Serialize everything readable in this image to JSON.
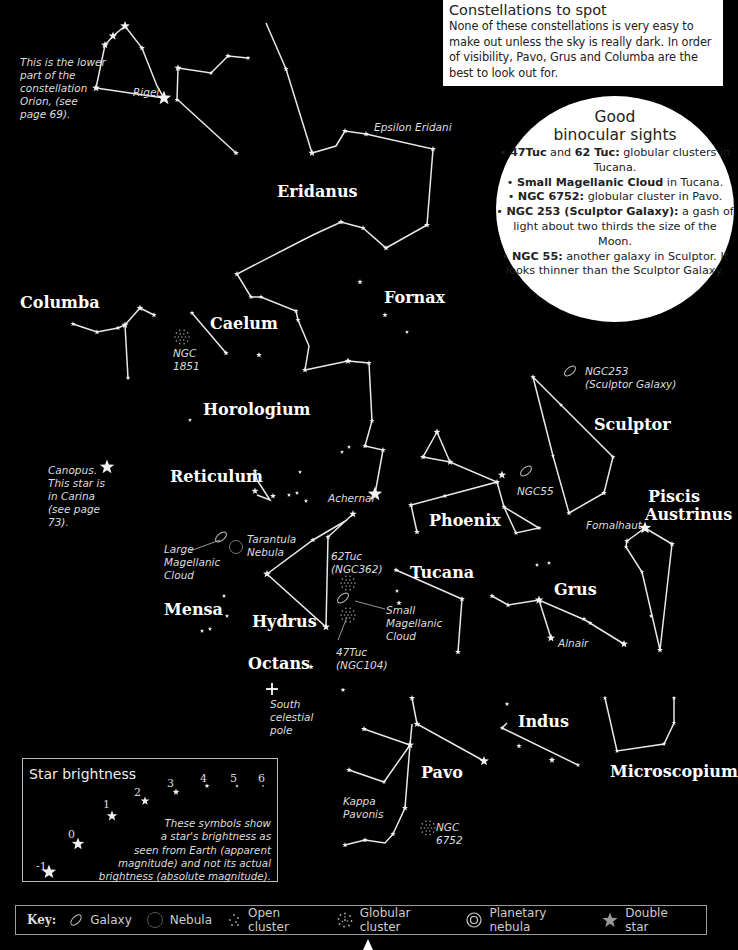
{
  "info_box": {
    "title": "Constellations to spot",
    "body": "None of these constellations is very easy to make out unless the sky is really dark. In order of visibility, Pavo, Grus and Columba are the best to look out for."
  },
  "binocular": {
    "title_line1": "Good",
    "title_line2": "binocular sights",
    "items": [
      {
        "bold": "47Tuc",
        "mid": " and ",
        "bold2": "62 Tuc:",
        "text": " globular clusters in Tucana."
      },
      {
        "bold": "Small Magellanic Cloud",
        "mid": "",
        "bold2": "",
        "text": " in Tucana."
      },
      {
        "bold": "NGC 6752:",
        "mid": "",
        "bold2": "",
        "text": " globular cluster in Pavo."
      },
      {
        "bold": "NGC 253 (Sculptor Galaxy):",
        "mid": "",
        "bold2": "",
        "text": " a gash of light about two thirds the size of the Moon."
      },
      {
        "bold": "NGC 55:",
        "mid": "",
        "bold2": "",
        "text": " another galaxy in Sculptor. It looks thinner than the Sculptor Galaxy."
      }
    ]
  },
  "constellations": [
    {
      "name": "Eridanus",
      "x": 277,
      "y": 182
    },
    {
      "name": "Fornax",
      "x": 384,
      "y": 288
    },
    {
      "name": "Columba",
      "x": 20,
      "y": 293
    },
    {
      "name": "Caelum",
      "x": 210,
      "y": 314
    },
    {
      "name": "Horologium",
      "x": 203,
      "y": 400
    },
    {
      "name": "Sculptor",
      "x": 594,
      "y": 415
    },
    {
      "name": "Reticulum",
      "x": 170,
      "y": 467
    },
    {
      "name": "Piscis",
      "x": 648,
      "y": 487
    },
    {
      "name": "Austrinus",
      "x": 645,
      "y": 505
    },
    {
      "name": "Phoenix",
      "x": 429,
      "y": 511
    },
    {
      "name": "Tucana",
      "x": 410,
      "y": 563
    },
    {
      "name": "Grus",
      "x": 554,
      "y": 580
    },
    {
      "name": "Mensa",
      "x": 164,
      "y": 600
    },
    {
      "name": "Hydrus",
      "x": 252,
      "y": 612
    },
    {
      "name": "Octans",
      "x": 248,
      "y": 654
    },
    {
      "name": "Indus",
      "x": 518,
      "y": 712
    },
    {
      "name": "Pavo",
      "x": 421,
      "y": 763
    },
    {
      "name": "Microscopium",
      "x": 610,
      "y": 762
    }
  ],
  "notes": [
    {
      "text": "This is the lower\npart of the\nconstellation\nOrion, (see\npage 69).",
      "x": 20,
      "y": 56
    },
    {
      "text": "Rigel",
      "x": 133,
      "y": 86
    },
    {
      "text": "Epsilon Eridani",
      "x": 374,
      "y": 121
    },
    {
      "text": "NGC\n1851",
      "x": 173,
      "y": 347
    },
    {
      "text": "NGC253\n(Sculptor Galaxy)",
      "x": 585,
      "y": 365
    },
    {
      "text": "Canopus.\nThis star is\nin Carina\n(see page\n73).",
      "x": 48,
      "y": 464
    },
    {
      "text": "Achernar",
      "x": 328,
      "y": 492
    },
    {
      "text": "NGC55",
      "x": 517,
      "y": 485
    },
    {
      "text": "Fomalhaut",
      "x": 586,
      "y": 519
    },
    {
      "text": "Tarantula\nNebula",
      "x": 247,
      "y": 533
    },
    {
      "text": "Large\nMagellanic\nCloud",
      "x": 164,
      "y": 543
    },
    {
      "text": "62Tuc\n(NGC362)",
      "x": 331,
      "y": 550
    },
    {
      "text": "Small\nMagellanic\nCloud",
      "x": 386,
      "y": 604
    },
    {
      "text": "Alnair",
      "x": 558,
      "y": 637
    },
    {
      "text": "47Tuc\n(NGC104)",
      "x": 336,
      "y": 646
    },
    {
      "text": "South\ncelestial\npole",
      "x": 270,
      "y": 698
    },
    {
      "text": "Kappa\nPavonis",
      "x": 343,
      "y": 795
    },
    {
      "text": "NGC\n6752",
      "x": 436,
      "y": 821
    }
  ],
  "star_brightness": {
    "title": "Star brightness",
    "description": "These symbols show\na star's brightness as\nseen from Earth (apparent\nmagnitude) and not its actual\nbrightness (absolute magnitude).",
    "magnitudes": [
      {
        "label": "-1",
        "x": 13,
        "y": 101,
        "sx": 26,
        "sy": 113,
        "r": 7.5
      },
      {
        "label": "0",
        "x": 45,
        "y": 69,
        "sx": 55,
        "sy": 85,
        "r": 6.5
      },
      {
        "label": "1",
        "x": 80,
        "y": 39,
        "sx": 89,
        "sy": 57,
        "r": 5.5
      },
      {
        "label": "2",
        "x": 111,
        "y": 27,
        "sx": 122,
        "sy": 42,
        "r": 4.5
      },
      {
        "label": "3",
        "x": 144,
        "y": 18,
        "sx": 153,
        "sy": 33,
        "r": 3.5
      },
      {
        "label": "4",
        "x": 177,
        "y": 13,
        "sx": 184,
        "sy": 27,
        "r": 2.6
      },
      {
        "label": "5",
        "x": 207,
        "y": 13,
        "sx": 214,
        "sy": 27,
        "r": 1.8
      },
      {
        "label": "6",
        "x": 235,
        "y": 13,
        "sx": 240,
        "sy": 27,
        "r": 1.2
      }
    ]
  },
  "key": {
    "label": "Key:",
    "items": [
      {
        "icon": "galaxy-icon",
        "label": "Galaxy"
      },
      {
        "icon": "nebula-icon",
        "label": "Nebula"
      },
      {
        "icon": "open-cluster-icon",
        "label": "Open cluster"
      },
      {
        "icon": "globular-cluster-icon",
        "label": "Globular cluster"
      },
      {
        "icon": "planetary-nebula-icon",
        "label": "Planetary nebula"
      },
      {
        "icon": "double-star-icon",
        "label": "Double star"
      }
    ]
  },
  "chart_lines": [
    [
      [
        96,
        88
      ],
      [
        105,
        45
      ],
      [
        113,
        36
      ],
      [
        125,
        26
      ],
      [
        142,
        48
      ],
      [
        157,
        86
      ],
      [
        164,
        98
      ]
    ],
    [
      [
        96,
        88
      ],
      [
        164,
        98
      ]
    ],
    [
      [
        178,
        68
      ],
      [
        177,
        100
      ]
    ],
    [
      [
        178,
        68
      ],
      [
        211,
        73
      ],
      [
        228,
        56
      ],
      [
        248,
        58
      ]
    ],
    [
      [
        178,
        100
      ],
      [
        236,
        153
      ]
    ],
    [
      [
        266,
        23
      ],
      [
        286,
        69
      ],
      [
        312,
        153
      ],
      [
        336,
        146
      ],
      [
        345,
        131
      ],
      [
        366,
        134
      ],
      [
        433,
        149
      ],
      [
        427,
        225
      ],
      [
        386,
        248
      ],
      [
        363,
        228
      ],
      [
        341,
        222
      ],
      [
        315,
        234
      ],
      [
        303,
        240
      ],
      [
        237,
        274
      ],
      [
        251,
        297
      ],
      [
        261,
        297
      ],
      [
        296,
        311
      ],
      [
        298,
        320
      ],
      [
        309,
        346
      ],
      [
        305,
        370
      ],
      [
        348,
        361
      ],
      [
        369,
        363
      ],
      [
        372,
        421
      ],
      [
        365,
        446
      ],
      [
        383,
        450
      ],
      [
        375,
        494
      ]
    ],
    [
      [
        73,
        324
      ],
      [
        97,
        332
      ],
      [
        118,
        328
      ],
      [
        125,
        325
      ],
      [
        140,
        308
      ],
      [
        154,
        315
      ]
    ],
    [
      [
        125,
        325
      ],
      [
        128,
        378
      ]
    ],
    [
      [
        192,
        313
      ],
      [
        226,
        353
      ]
    ],
    [
      [
        255,
        471
      ],
      [
        257,
        480
      ],
      [
        270,
        500
      ],
      [
        257,
        495
      ]
    ],
    [
      [
        353,
        514
      ],
      [
        328,
        537
      ],
      [
        326,
        627
      ],
      [
        267,
        574
      ],
      [
        313,
        540
      ],
      [
        347,
        520
      ]
    ],
    [
      [
        437,
        432
      ],
      [
        423,
        457
      ],
      [
        450,
        462
      ],
      [
        497,
        482
      ],
      [
        411,
        505
      ],
      [
        417,
        532
      ]
    ],
    [
      [
        437,
        432
      ],
      [
        450,
        462
      ]
    ],
    [
      [
        497,
        482
      ],
      [
        504,
        507
      ],
      [
        539,
        528
      ],
      [
        516,
        533
      ],
      [
        504,
        507
      ]
    ],
    [
      [
        533,
        377
      ],
      [
        561,
        405
      ],
      [
        613,
        457
      ],
      [
        604,
        493
      ],
      [
        569,
        513
      ],
      [
        553,
        456
      ],
      [
        533,
        377
      ]
    ],
    [
      [
        627,
        541
      ],
      [
        645,
        528
      ],
      [
        672,
        544
      ],
      [
        660,
        650
      ],
      [
        642,
        572
      ],
      [
        626,
        547
      ],
      [
        627,
        541
      ]
    ],
    [
      [
        492,
        596
      ],
      [
        508,
        605
      ],
      [
        539,
        600
      ],
      [
        585,
        620
      ],
      [
        624,
        644
      ]
    ],
    [
      [
        539,
        600
      ],
      [
        551,
        638
      ]
    ],
    [
      [
        396,
        570
      ],
      [
        462,
        599
      ],
      [
        458,
        652
      ]
    ],
    [
      [
        412,
        698
      ],
      [
        417,
        724
      ],
      [
        484,
        761
      ]
    ],
    [
      [
        412,
        724
      ],
      [
        410,
        745
      ],
      [
        405,
        808
      ],
      [
        393,
        834
      ]
    ],
    [
      [
        410,
        745
      ],
      [
        384,
        782
      ],
      [
        349,
        770
      ]
    ],
    [
      [
        410,
        745
      ],
      [
        364,
        729
      ]
    ],
    [
      [
        507,
        723
      ],
      [
        502,
        728
      ],
      [
        578,
        765
      ]
    ],
    [
      [
        605,
        698
      ],
      [
        617,
        751
      ],
      [
        664,
        744
      ],
      [
        674,
        723
      ],
      [
        674,
        698
      ]
    ],
    [
      [
        345,
        845
      ],
      [
        365,
        840
      ],
      [
        385,
        843
      ],
      [
        393,
        834
      ]
    ]
  ],
  "chart_stars": [
    {
      "x": 96,
      "y": 88,
      "r": 3.5
    },
    {
      "x": 105,
      "y": 45,
      "r": 3.5
    },
    {
      "x": 113,
      "y": 36,
      "r": 4
    },
    {
      "x": 125,
      "y": 26,
      "r": 4.5
    },
    {
      "x": 142,
      "y": 48,
      "r": 2.5
    },
    {
      "x": 164,
      "y": 98,
      "r": 7
    },
    {
      "x": 178,
      "y": 68,
      "r": 3.2
    },
    {
      "x": 177,
      "y": 100,
      "r": 2
    },
    {
      "x": 211,
      "y": 73,
      "r": 1.8
    },
    {
      "x": 228,
      "y": 56,
      "r": 2.3
    },
    {
      "x": 248,
      "y": 58,
      "r": 2
    },
    {
      "x": 236,
      "y": 153,
      "r": 2.3
    },
    {
      "x": 286,
      "y": 69,
      "r": 2.2
    },
    {
      "x": 312,
      "y": 153,
      "r": 3.2
    },
    {
      "x": 345,
      "y": 131,
      "r": 2.5
    },
    {
      "x": 366,
      "y": 134,
      "r": 2.5
    },
    {
      "x": 433,
      "y": 149,
      "r": 2.5
    },
    {
      "x": 427,
      "y": 225,
      "r": 2.5
    },
    {
      "x": 386,
      "y": 248,
      "r": 2.5
    },
    {
      "x": 363,
      "y": 228,
      "r": 2.2
    },
    {
      "x": 341,
      "y": 222,
      "r": 2.5
    },
    {
      "x": 237,
      "y": 274,
      "r": 2.5
    },
    {
      "x": 251,
      "y": 297,
      "r": 2
    },
    {
      "x": 261,
      "y": 297,
      "r": 2
    },
    {
      "x": 296,
      "y": 311,
      "r": 2
    },
    {
      "x": 298,
      "y": 320,
      "r": 2
    },
    {
      "x": 348,
      "y": 361,
      "r": 3
    },
    {
      "x": 369,
      "y": 363,
      "r": 2.2
    },
    {
      "x": 305,
      "y": 370,
      "r": 2.5
    },
    {
      "x": 372,
      "y": 421,
      "r": 2
    },
    {
      "x": 365,
      "y": 446,
      "r": 2.2
    },
    {
      "x": 383,
      "y": 450,
      "r": 2.3
    },
    {
      "x": 375,
      "y": 494,
      "r": 7
    },
    {
      "x": 360,
      "y": 282,
      "r": 2.2
    },
    {
      "x": 385,
      "y": 315,
      "r": 2.2
    },
    {
      "x": 407,
      "y": 332,
      "r": 1.5
    },
    {
      "x": 259,
      "y": 355,
      "r": 2.3
    },
    {
      "x": 349,
      "y": 447,
      "r": 1.5
    },
    {
      "x": 342,
      "y": 452,
      "r": 1.5
    },
    {
      "x": 73,
      "y": 324,
      "r": 2
    },
    {
      "x": 97,
      "y": 332,
      "r": 2.2
    },
    {
      "x": 118,
      "y": 328,
      "r": 2
    },
    {
      "x": 125,
      "y": 325,
      "r": 3.2
    },
    {
      "x": 140,
      "y": 308,
      "r": 3
    },
    {
      "x": 154,
      "y": 315,
      "r": 2.2
    },
    {
      "x": 128,
      "y": 378,
      "r": 1.8
    },
    {
      "x": 192,
      "y": 313,
      "r": 2
    },
    {
      "x": 226,
      "y": 353,
      "r": 2.2
    },
    {
      "x": 255,
      "y": 471,
      "r": 2.2
    },
    {
      "x": 255,
      "y": 491,
      "r": 3
    },
    {
      "x": 273,
      "y": 496,
      "r": 2.5
    },
    {
      "x": 289,
      "y": 495,
      "r": 1.6
    },
    {
      "x": 297,
      "y": 493,
      "r": 1.6
    },
    {
      "x": 306,
      "y": 501,
      "r": 1.6
    },
    {
      "x": 300,
      "y": 472,
      "r": 1.5
    },
    {
      "x": 353,
      "y": 514,
      "r": 3.3
    },
    {
      "x": 328,
      "y": 537,
      "r": 2.2
    },
    {
      "x": 313,
      "y": 540,
      "r": 2.2
    },
    {
      "x": 267,
      "y": 574,
      "r": 3.5
    },
    {
      "x": 326,
      "y": 627,
      "r": 3.5
    },
    {
      "x": 224,
      "y": 596,
      "r": 1.6
    },
    {
      "x": 227,
      "y": 616,
      "r": 1.6
    },
    {
      "x": 210,
      "y": 629,
      "r": 1.6
    },
    {
      "x": 202,
      "y": 631,
      "r": 1.6
    },
    {
      "x": 311,
      "y": 667,
      "r": 2.3
    },
    {
      "x": 343,
      "y": 690,
      "r": 2
    },
    {
      "x": 437,
      "y": 432,
      "r": 3
    },
    {
      "x": 423,
      "y": 457,
      "r": 2.5
    },
    {
      "x": 450,
      "y": 462,
      "r": 3
    },
    {
      "x": 497,
      "y": 482,
      "r": 2.5
    },
    {
      "x": 502,
      "y": 475,
      "r": 3.8
    },
    {
      "x": 445,
      "y": 496,
      "r": 2
    },
    {
      "x": 411,
      "y": 505,
      "r": 2.5
    },
    {
      "x": 417,
      "y": 532,
      "r": 2.5
    },
    {
      "x": 504,
      "y": 507,
      "r": 2.2
    },
    {
      "x": 539,
      "y": 528,
      "r": 2
    },
    {
      "x": 516,
      "y": 533,
      "r": 2
    },
    {
      "x": 537,
      "y": 565,
      "r": 1.6
    },
    {
      "x": 549,
      "y": 563,
      "r": 1.6
    },
    {
      "x": 533,
      "y": 377,
      "r": 2.2
    },
    {
      "x": 561,
      "y": 405,
      "r": 1.7
    },
    {
      "x": 613,
      "y": 457,
      "r": 2
    },
    {
      "x": 604,
      "y": 493,
      "r": 2.3
    },
    {
      "x": 569,
      "y": 513,
      "r": 2.2
    },
    {
      "x": 553,
      "y": 456,
      "r": 1.6
    },
    {
      "x": 645,
      "y": 528,
      "r": 6
    },
    {
      "x": 627,
      "y": 541,
      "r": 2.3
    },
    {
      "x": 626,
      "y": 547,
      "r": 1.7
    },
    {
      "x": 672,
      "y": 544,
      "r": 2.5
    },
    {
      "x": 642,
      "y": 572,
      "r": 1.7
    },
    {
      "x": 651,
      "y": 616,
      "r": 1.6
    },
    {
      "x": 660,
      "y": 650,
      "r": 2.5
    },
    {
      "x": 492,
      "y": 596,
      "r": 2.2
    },
    {
      "x": 508,
      "y": 605,
      "r": 2.2
    },
    {
      "x": 539,
      "y": 600,
      "r": 4
    },
    {
      "x": 584,
      "y": 619,
      "r": 2
    },
    {
      "x": 590,
      "y": 623,
      "r": 2
    },
    {
      "x": 624,
      "y": 644,
      "r": 3.5
    },
    {
      "x": 551,
      "y": 638,
      "r": 3.8
    },
    {
      "x": 396,
      "y": 570,
      "r": 2.2
    },
    {
      "x": 462,
      "y": 599,
      "r": 2.5
    },
    {
      "x": 458,
      "y": 652,
      "r": 2.5
    },
    {
      "x": 397,
      "y": 591,
      "r": 1.6
    },
    {
      "x": 399,
      "y": 603,
      "r": 2.2
    },
    {
      "x": 412,
      "y": 698,
      "r": 2.5
    },
    {
      "x": 417,
      "y": 724,
      "r": 3
    },
    {
      "x": 484,
      "y": 761,
      "r": 4.5
    },
    {
      "x": 410,
      "y": 745,
      "r": 3.5
    },
    {
      "x": 364,
      "y": 729,
      "r": 2.5
    },
    {
      "x": 384,
      "y": 782,
      "r": 1.8
    },
    {
      "x": 349,
      "y": 770,
      "r": 2.3
    },
    {
      "x": 405,
      "y": 808,
      "r": 2.5
    },
    {
      "x": 393,
      "y": 834,
      "r": 2.2
    },
    {
      "x": 365,
      "y": 840,
      "r": 2.2
    },
    {
      "x": 345,
      "y": 845,
      "r": 2.2
    },
    {
      "x": 507,
      "y": 704,
      "r": 1.8
    },
    {
      "x": 502,
      "y": 728,
      "r": 1.8
    },
    {
      "x": 578,
      "y": 765,
      "r": 1.8
    },
    {
      "x": 519,
      "y": 746,
      "r": 2.2
    },
    {
      "x": 552,
      "y": 760,
      "r": 2.8
    },
    {
      "x": 605,
      "y": 698,
      "r": 1.8
    },
    {
      "x": 617,
      "y": 751,
      "r": 1.8
    },
    {
      "x": 664,
      "y": 744,
      "r": 1.8
    },
    {
      "x": 674,
      "y": 723,
      "r": 1.8
    },
    {
      "x": 674,
      "y": 698,
      "r": 1.8
    },
    {
      "x": 107,
      "y": 467,
      "r": 7
    },
    {
      "x": 190,
      "y": 420,
      "r": 1.5
    }
  ],
  "deep_sky": {
    "galaxies": [
      {
        "x": 570,
        "y": 371
      },
      {
        "x": 526,
        "y": 471
      },
      {
        "x": 221,
        "y": 537
      },
      {
        "x": 343,
        "y": 598
      }
    ],
    "nebulae": [
      {
        "x": 236,
        "y": 547
      }
    ],
    "globular_clusters": [
      {
        "x": 182,
        "y": 337
      },
      {
        "x": 348,
        "y": 583
      },
      {
        "x": 348,
        "y": 615
      },
      {
        "x": 428,
        "y": 828
      }
    ],
    "south_pole": {
      "x": 272,
      "y": 689
    }
  },
  "label_lines": [
    [
      [
        190,
        551
      ],
      [
        220,
        540
      ]
    ],
    [
      [
        355,
        601
      ],
      [
        385,
        609
      ]
    ],
    [
      [
        347,
        617
      ],
      [
        338,
        640
      ]
    ]
  ]
}
